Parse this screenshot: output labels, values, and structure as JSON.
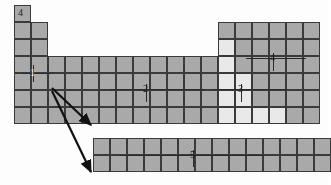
{
  "diagram": {
    "colors": {
      "cell_gray": "#a9a9a9",
      "cell_light": "#e9e9e9",
      "cell_border": "#3a3a3a",
      "outline": "#2b2b2b",
      "background": "#fdfdfd",
      "label_dark": "#1c1c1c",
      "label_light": "#f2f2f2"
    },
    "geometry": {
      "cell_w": 17,
      "cell_h": 17,
      "origin_x": 14,
      "origin_y": 5
    },
    "labels": [
      {
        "id": "label-4-corner",
        "text": "4",
        "x": 18,
        "y": 8,
        "style": "dark"
      },
      {
        "id": "label-1",
        "text": "1",
        "x": 30,
        "y": 68,
        "style": "light"
      },
      {
        "id": "label-2",
        "text": "2",
        "x": 143,
        "y": 84,
        "style": "dark"
      },
      {
        "id": "label-3",
        "text": "3",
        "x": 238,
        "y": 84,
        "style": "dark"
      },
      {
        "id": "label-4",
        "text": "4",
        "x": 270,
        "y": 53,
        "style": "dark"
      },
      {
        "id": "label-5",
        "text": "5",
        "x": 190,
        "y": 150,
        "style": "dark"
      }
    ],
    "leader_ticks": [
      {
        "id": "tick-1",
        "x": 22,
        "y": 73,
        "w": 30,
        "h": 1
      },
      {
        "id": "tick-2",
        "x": 110,
        "y": 89,
        "w": 95,
        "h": 1
      },
      {
        "id": "tick-2b",
        "x": 146,
        "y": 84,
        "w": 1,
        "h": 18
      },
      {
        "id": "tick-3",
        "x": 212,
        "y": 89,
        "w": 75,
        "h": 1
      },
      {
        "id": "tick-3b",
        "x": 241,
        "y": 84,
        "w": 1,
        "h": 18
      },
      {
        "id": "tick-4",
        "x": 246,
        "y": 58,
        "w": 60,
        "h": 1
      },
      {
        "id": "tick-4b",
        "x": 273,
        "y": 53,
        "w": 1,
        "h": 18
      },
      {
        "id": "tick-5",
        "x": 120,
        "y": 155,
        "w": 145,
        "h": 1
      },
      {
        "id": "tick-5b",
        "x": 193,
        "y": 150,
        "w": 1,
        "h": 17
      },
      {
        "id": "tick-1b",
        "x": 33,
        "y": 65,
        "w": 1,
        "h": 17
      }
    ],
    "arrows": [
      {
        "id": "arrow-upper",
        "x1": 52,
        "y1": 88,
        "x2": 91,
        "y2": 125
      },
      {
        "id": "arrow-lower",
        "x1": 52,
        "y1": 91,
        "x2": 91,
        "y2": 172
      }
    ],
    "blocks": [
      {
        "id": "s-block-col1",
        "label": "s-block column 1",
        "cols": 1,
        "rows": 7,
        "col": 0,
        "row": 0,
        "shade": "gray"
      },
      {
        "id": "s-block-col2",
        "label": "s-block column 2",
        "cols": 1,
        "rows": 6,
        "col": 1,
        "row": 1,
        "shade": "gray"
      },
      {
        "id": "d-block",
        "label": "d-block transition metals",
        "cols": 10,
        "rows": 4,
        "col": 2,
        "row": 3,
        "shade": "gray"
      },
      {
        "id": "p-block",
        "label": "p-block main group",
        "cols": 6,
        "rows": 6,
        "col": 12,
        "row": 1,
        "shade": "gray"
      },
      {
        "id": "f-block",
        "label": "f-block inner transition",
        "cols": 14,
        "rows": 2,
        "col": 0,
        "row": 0,
        "shade": "gray",
        "detached": true
      }
    ],
    "light_cells": [
      {
        "col": 12,
        "row": 2
      },
      {
        "col": 12,
        "row": 3
      },
      {
        "col": 12,
        "row": 4
      },
      {
        "col": 12,
        "row": 5
      },
      {
        "col": 12,
        "row": 6
      },
      {
        "col": 13,
        "row": 4
      },
      {
        "col": 13,
        "row": 5
      },
      {
        "col": 13,
        "row": 6
      },
      {
        "col": 14,
        "row": 6
      },
      {
        "col": 15,
        "row": 6
      }
    ],
    "f_block": {
      "id": "f-block-detached",
      "x": 93,
      "y": 138,
      "cols": 14,
      "rows": 2
    },
    "callouts": {
      "number_1": "1",
      "number_2": "2",
      "number_3": "3",
      "number_4": "4",
      "number_5": "5",
      "corner_number": "4"
    }
  }
}
